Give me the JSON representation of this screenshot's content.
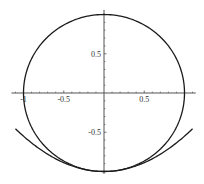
{
  "chart_data": {
    "type": "line",
    "title": "",
    "xlabel": "",
    "ylabel": "",
    "xlim": [
      -1.15,
      1.14
    ],
    "ylim": [
      -1.03,
      1.06
    ],
    "grid": false,
    "legend": null,
    "x_ticks": [
      {
        "value": -1,
        "label": "-1"
      },
      {
        "value": -0.5,
        "label": "-0.5"
      },
      {
        "value": 0.5,
        "label": "0.5"
      }
    ],
    "y_ticks": [
      {
        "value": 0.5,
        "label": "0.5"
      },
      {
        "value": -0.5,
        "label": "-0.5"
      }
    ],
    "minor_tick_step": 0.1,
    "series": [
      {
        "name": "unit circle",
        "kind": "parametric",
        "equation": "x^2 + y^2 = 1",
        "t_range": [
          0,
          6.2832
        ],
        "color": "#1a1a1a"
      },
      {
        "name": "parabola",
        "kind": "function",
        "equation": "y = 0.45 x^2 - 1",
        "coef_a": 0.45,
        "offset": -1,
        "x_range": [
          -1.1,
          1.1
        ],
        "color": "#1a1a1a"
      }
    ]
  },
  "layout": {
    "origin_px": [
      104,
      93
    ],
    "scale_px": [
      80.5,
      78.5
    ]
  }
}
